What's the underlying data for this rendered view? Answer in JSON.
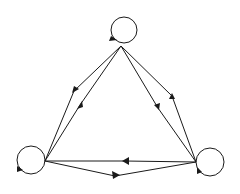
{
  "diagram": {
    "type": "directed-graph",
    "width": 240,
    "height": 194,
    "stroke_color": "#1a1a1a",
    "background": "#ffffff",
    "nodes": [
      {
        "id": "top",
        "vertex": [
          121,
          46
        ],
        "loop_center": [
          124,
          30
        ],
        "loop_radius": 13,
        "loop_arrow": [
          111,
          36,
          117,
          40,
          109,
          41
        ]
      },
      {
        "id": "left",
        "vertex": [
          45,
          161
        ],
        "loop_center": [
          31,
          160
        ],
        "loop_radius": 14,
        "loop_arrow": [
          17,
          166,
          23,
          170,
          17,
          172
        ]
      },
      {
        "id": "right",
        "vertex": [
          196,
          162
        ],
        "loop_center": [
          210,
          162
        ],
        "loop_radius": 14,
        "loop_arrow": [
          197,
          167,
          202,
          172,
          197,
          174
        ]
      }
    ],
    "edges": [
      {
        "from": "top",
        "to": "left",
        "mid": [
          74,
          91
        ],
        "arrow": [
          72,
          93,
          79,
          89,
          74,
          86
        ]
      },
      {
        "from": "left",
        "to": "top",
        "mid": [
          80,
          105
        ],
        "arrow": [
          77,
          109,
          83,
          107,
          82,
          101
        ]
      },
      {
        "from": "top",
        "to": "right",
        "mid": [
          158,
          108
        ],
        "arrow": [
          159,
          110,
          160,
          103,
          154,
          105
        ]
      },
      {
        "from": "right",
        "to": "top",
        "mid": [
          172,
          96
        ],
        "arrow": [
          172,
          93,
          169,
          99,
          175,
          99
        ]
      },
      {
        "from": "right",
        "to": "left",
        "mid": [
          125,
          161
        ],
        "arrow": [
          122,
          161,
          129,
          157,
          129,
          165
        ]
      },
      {
        "from": "left",
        "to": "right",
        "mid": [
          115,
          176
        ],
        "arrow": [
          120,
          175,
          112,
          171,
          113,
          179
        ]
      }
    ]
  }
}
